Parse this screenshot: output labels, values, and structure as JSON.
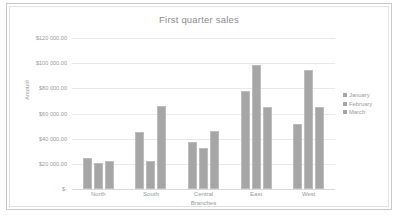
{
  "chart_data": {
    "type": "bar",
    "title": "First quarter sales",
    "xlabel": "Branches",
    "ylabel": "Amount",
    "categories": [
      "North",
      "South",
      "Central",
      "East",
      "West"
    ],
    "series": [
      {
        "name": "January",
        "values": [
          24500,
          45700,
          37500,
          77500,
          51400
        ],
        "color": "#a6a6a6"
      },
      {
        "name": "February",
        "values": [
          21000,
          22000,
          32600,
          98800,
          94700
        ],
        "color": "#a6a6a6"
      },
      {
        "name": "March",
        "values": [
          22000,
          66000,
          46500,
          65300,
          65300
        ],
        "color": "#a6a6a6"
      }
    ],
    "ylim": [
      0,
      120000
    ],
    "y_ticks": [
      0,
      20000,
      40000,
      60000,
      80000,
      100000,
      120000
    ],
    "y_tick_labels": [
      "$-",
      "$20 000.00",
      "$40 000.00",
      "$60 000.00",
      "$80 000.00",
      "$100 000.00",
      "$120 000.00"
    ],
    "grid": true,
    "legend_position": "right",
    "bar_color": "#a6a6a6",
    "gridline_color": "#e9e9e9",
    "text_color": "#9a9a9a"
  }
}
